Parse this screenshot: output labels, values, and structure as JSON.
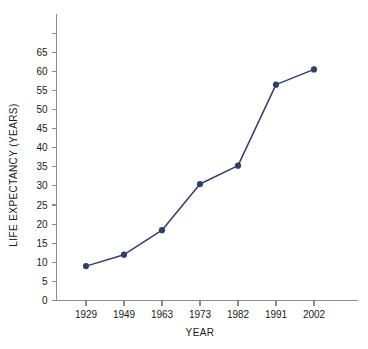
{
  "chart_data": {
    "type": "line",
    "title": "",
    "xlabel": "YEAR",
    "ylabel": "LIFE EXPECTANCY (YEARS)",
    "categories": [
      "1929",
      "1949",
      "1963",
      "1973",
      "1982",
      "1991",
      "2002"
    ],
    "values": [
      9,
      12,
      18.4,
      30.5,
      35.3,
      56.5,
      60.5
    ],
    "series": [
      {
        "name": "Life expectancy",
        "values": [
          9,
          12,
          18.4,
          30.5,
          35.3,
          56.5,
          60.5
        ]
      }
    ],
    "ylim": [
      0,
      70
    ],
    "ytick_labels": [
      "0",
      "5",
      "10",
      "15",
      "20",
      "25",
      "30",
      "35",
      "40",
      "45",
      "50",
      "55",
      "60",
      "65"
    ],
    "ytick_values": [
      0,
      5,
      10,
      15,
      20,
      25,
      30,
      35,
      40,
      45,
      50,
      55,
      60,
      65
    ],
    "ytick_unlabeled": [
      70
    ],
    "xtick_labels": [
      "1929",
      "1949",
      "1963",
      "1973",
      "1982",
      "1991",
      "2002"
    ],
    "grid": false,
    "legend": "none",
    "marker": "circle",
    "line_color": "#2e3f6e",
    "marker_color": "#2e3f6e",
    "axis_color": "#8c8c8c",
    "background_color": "#ffffff"
  }
}
